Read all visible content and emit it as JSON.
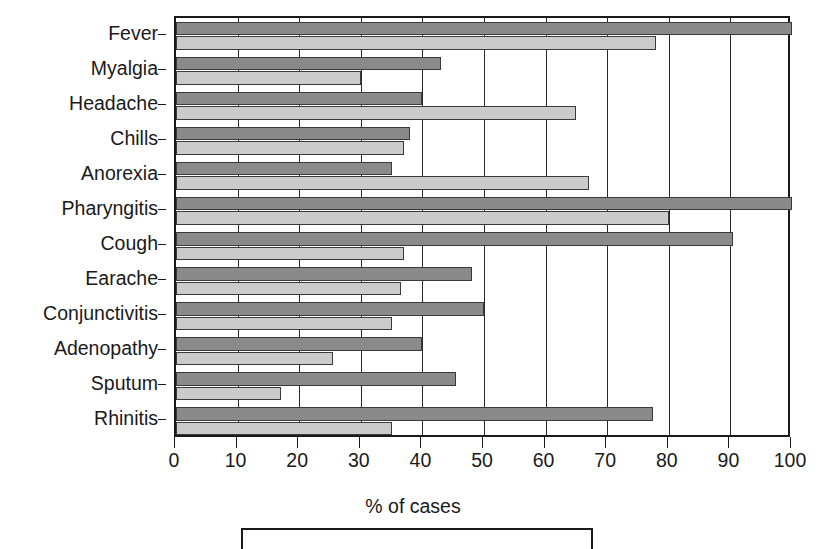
{
  "chart_data": {
    "type": "bar",
    "orientation": "horizontal",
    "title": "",
    "xlabel": "% of cases",
    "ylabel": "",
    "xlim": [
      0,
      100
    ],
    "xticks": [
      0,
      10,
      20,
      30,
      40,
      50,
      60,
      70,
      80,
      90,
      100
    ],
    "xtick_labels": [
      "0",
      "10",
      "20",
      "30",
      "40",
      "50",
      "60",
      "70",
      "80",
      "90",
      "100"
    ],
    "grid": true,
    "grid_axis": "x",
    "legend_position": "bottom",
    "legend_visible_cropped": true,
    "categories": [
      "Fever",
      "Myalgia",
      "Headache",
      "Chills",
      "Anorexia",
      "Pharyngitis",
      "Cough",
      "Earache",
      "Conjunctivitis",
      "Adenopathy",
      "Sputum",
      "Rhinitis"
    ],
    "series": [
      {
        "name": "series-1",
        "color": "#8a8a8a",
        "values": [
          100,
          43,
          40,
          38,
          35,
          100,
          90.5,
          48,
          50,
          40,
          45.5,
          77.5
        ]
      },
      {
        "name": "series-2",
        "color": "#cbcbcb",
        "values": [
          78,
          30,
          65,
          37,
          67,
          80,
          37,
          36.5,
          35,
          25.5,
          17,
          35
        ]
      }
    ]
  },
  "axis": {
    "xlabel": "% of cases"
  },
  "colors": {
    "series_1": "#8a8a8a",
    "series_2": "#cbcbcb",
    "axis": "#1a1a1a",
    "grid": "#2a2a2a",
    "background": "#ffffff"
  }
}
